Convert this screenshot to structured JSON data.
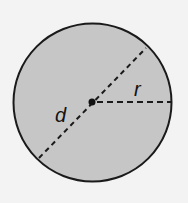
{
  "diagram": {
    "type": "circle-geometry",
    "colors": {
      "background": "#f3f3f3",
      "circle_fill": "#c6c6c6",
      "stroke": "#1a1a1a"
    },
    "circle": {
      "cx": 92.5,
      "cy": 102.5,
      "r": 79
    },
    "center_point": {
      "cx": 92,
      "cy": 102
    },
    "diameter": {
      "label": "d",
      "x1": 39,
      "y1": 158,
      "x2": 146,
      "y2": 48
    },
    "radius": {
      "label": "r",
      "x1": 92,
      "y1": 102,
      "x2": 171,
      "y2": 102
    }
  }
}
